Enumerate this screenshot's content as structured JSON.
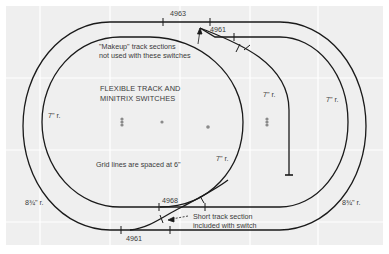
{
  "diagram": {
    "title_lines": [
      "FLEXIBLE TRACK AND",
      "MINITRIX SWITCHES"
    ],
    "grid_note": "Grid lines are spaced at 6\"",
    "makeup_note_lines": [
      "\"Makeup\" track sections",
      "not used with these switches"
    ],
    "short_track_note_lines": [
      "Short track section",
      "included with switch"
    ],
    "part_labels": {
      "top_left_switch": "4963",
      "top_right_switch": "4961",
      "bottom_upper_switch": "4968",
      "bottom_lower_switch": "4961"
    },
    "radius_labels": {
      "left_inner": "7\" r.",
      "center_right_inner": "7\" r.",
      "spur": "7\" r.",
      "right_middle": "7\" r.",
      "left_outer": "8¾\" r.",
      "right_outer": "8¾\" r."
    },
    "colors": {
      "panel": "#efefef",
      "grid": "#ffffff",
      "track": "#1a1a1a",
      "text": "#3a3a3a",
      "marker": "#8a8a8a"
    }
  }
}
